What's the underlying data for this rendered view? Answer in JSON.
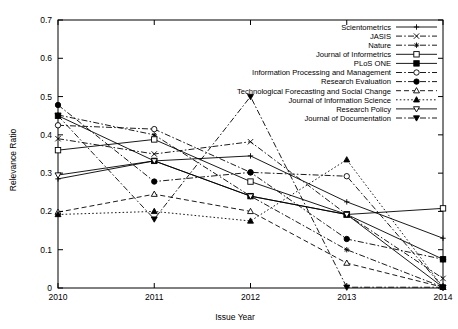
{
  "chart_data": {
    "type": "line",
    "title": "",
    "xlabel": "Issue Year",
    "ylabel": "Relevance Ratio",
    "categories": [
      "2010",
      "2011",
      "2012",
      "2013",
      "2014"
    ],
    "x": [
      2010,
      2011,
      2012,
      2013,
      2014
    ],
    "xlim": [
      2010,
      2014
    ],
    "ylim": [
      0,
      0.7
    ],
    "ytick_labels": [
      "0",
      "0.1",
      "0.2",
      "0.3",
      "0.4",
      "0.5",
      "0.6",
      "0.7"
    ],
    "ytick_values": [
      0,
      0.1,
      0.2,
      0.3,
      0.4,
      0.5,
      0.6,
      0.7
    ],
    "xtick_labels": [
      "2010",
      "2011",
      "2012",
      "2013",
      "2014"
    ],
    "grid": false,
    "legend_position": "top-right",
    "series": [
      {
        "name": "Scientometrics",
        "marker": "plus",
        "dash": "solid",
        "values": [
          0.285,
          0.332,
          0.345,
          0.225,
          0.13
        ]
      },
      {
        "name": "JASIS",
        "marker": "cross",
        "dash": "dashdot",
        "values": [
          0.39,
          0.35,
          0.382,
          0.192,
          0.025
        ]
      },
      {
        "name": "Nature",
        "marker": "star",
        "dash": "dashdot",
        "values": [
          0.452,
          0.4,
          0.24,
          0.1,
          0.002
        ]
      },
      {
        "name": "Journal of Informetrics",
        "marker": "square-open",
        "dash": "solid",
        "values": [
          0.36,
          0.388,
          0.278,
          0.192,
          0.208
        ]
      },
      {
        "name": "PLoS ONE",
        "marker": "square-filled",
        "dash": "solid",
        "values": [
          0.45,
          0.332,
          0.24,
          0.192,
          0.075
        ]
      },
      {
        "name": "Information Processing and Management",
        "marker": "circle-open",
        "dash": "dashdot",
        "values": [
          0.425,
          0.415,
          0.302,
          0.292,
          0.002
        ]
      },
      {
        "name": "Research Evaluation",
        "marker": "circle-filled",
        "dash": "dashdot",
        "values": [
          0.478,
          0.278,
          0.302,
          0.128,
          0.075
        ]
      },
      {
        "name": "Technological Forecasting and Social Change",
        "marker": "triangle-open",
        "dash": "dashed",
        "values": [
          0.198,
          0.245,
          0.2,
          0.065,
          0.002
        ]
      },
      {
        "name": "Journal of Information Science",
        "marker": "triangle-filled",
        "dash": "dotted",
        "values": [
          0.192,
          0.2,
          0.175,
          0.335,
          0.002
        ]
      },
      {
        "name": "Research Policy",
        "marker": "triangle-down-open",
        "dash": "solid",
        "values": [
          0.295,
          0.332,
          0.24,
          0.192,
          0.002
        ]
      },
      {
        "name": "Journal of Documentation",
        "marker": "triangle-down-filled",
        "dash": "dashdot",
        "values": [
          0.45,
          0.18,
          0.5,
          0.002,
          0.002
        ]
      }
    ]
  }
}
